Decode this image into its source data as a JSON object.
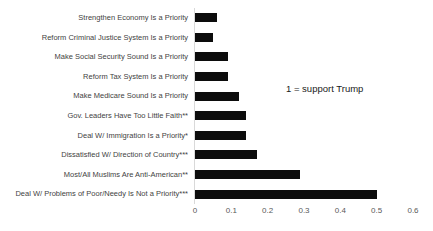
{
  "chart_data": {
    "type": "bar",
    "orientation": "horizontal",
    "title": "",
    "xlabel": "",
    "ylabel": "",
    "categories": [
      "Strengthen Economy Is a Priority",
      "Reform Criminal Justice System Is a Priority",
      "Make Social Security Sound Is a Priority",
      "Reform Tax System Is a Priority",
      "Make Medicare Sound Is a Priority",
      "Gov. Leaders Have Too Little Faith**",
      "Deal W/ Immigration Is a Priority*",
      "Dissatisfied W/ Direction of Country***",
      "Most/All Muslims Are Anti-American**",
      "Deal W/ Problems of Poor/Needy Is Not a Priority***"
    ],
    "values": [
      0.06,
      0.05,
      0.09,
      0.09,
      0.12,
      0.14,
      0.14,
      0.17,
      0.29,
      0.5
    ],
    "x_ticks": [
      "0",
      "0.1",
      "0.2",
      "0.3",
      "0.4",
      "0.5",
      "0.6"
    ],
    "x_tick_values": [
      0,
      0.1,
      0.2,
      0.3,
      0.4,
      0.5,
      0.6
    ],
    "xlim": [
      0,
      0.6
    ],
    "grid": "off",
    "legend": "none",
    "annotation": "1 = support Trump",
    "bar_color": "#0c0c0c",
    "label_color": "#3f3f3f",
    "tick_color": "#595959",
    "axis_line_color": "#d9d9d9",
    "background_color": "#ffffff"
  }
}
